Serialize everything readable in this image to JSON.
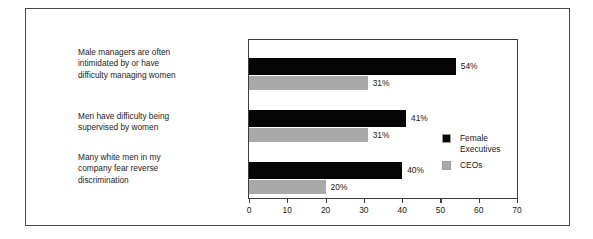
{
  "chart_data": {
    "type": "bar",
    "orientation": "horizontal",
    "title": "",
    "subtitle": "",
    "xlabel": "",
    "ylabel": "",
    "xlim": [
      0,
      70
    ],
    "xticks": [
      0,
      10,
      20,
      30,
      40,
      50,
      60,
      70
    ],
    "xtick_labels": [
      "0",
      "10",
      "20",
      "30",
      "40",
      "50",
      "60",
      "70"
    ],
    "grid": false,
    "legend_position": "right-inside",
    "categories": [
      "Male managers are often\nintimidated by or have\ndifficulty managing women",
      "Men have difficulty being\nsupervised by women",
      "Many white men in my\ncompany fear reverse\ndiscrimination"
    ],
    "series": [
      {
        "name": "Female\nExecutives",
        "legend_label": "Female\nExecutives",
        "color": "#050505",
        "values": [
          54,
          41,
          40
        ],
        "value_labels": [
          "54%",
          "41%",
          "40%"
        ]
      },
      {
        "name": "CEOs",
        "legend_label": "CEOs",
        "color": "#a9a9a9",
        "values": [
          31,
          31,
          20
        ],
        "value_labels": [
          "31%",
          "31%",
          "20%"
        ]
      }
    ]
  },
  "legend": {
    "items": [
      {
        "label": "Female\nExecutives",
        "color": "#050505"
      },
      {
        "label": "CEOs",
        "color": "#a9a9a9"
      }
    ]
  },
  "axis": {
    "x_tick_labels": [
      "0",
      "10",
      "20",
      "30",
      "40",
      "50",
      "60",
      "70"
    ]
  },
  "colors": {
    "female_executives": "#050505",
    "ceos": "#a9a9a9",
    "frame": "#4a4a4a",
    "plot_frame": "#3c3c3c",
    "background": "#ffffff",
    "text": "#171717"
  }
}
